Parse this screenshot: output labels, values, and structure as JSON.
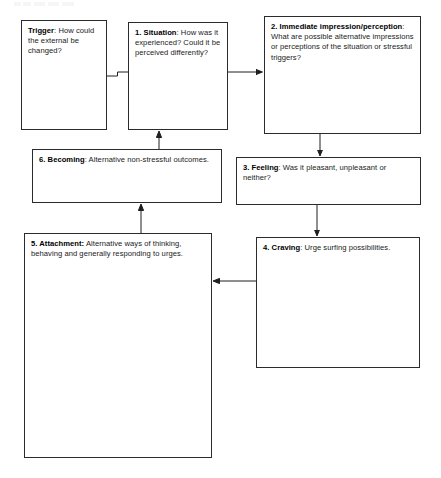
{
  "diagram": {
    "title_visible": false,
    "header_remnant": "",
    "type": "flowchart",
    "boxes": [
      {
        "id": "trigger",
        "label": "Trigger",
        "separator": ": ",
        "text": "How could the external be changed?"
      },
      {
        "id": "situation",
        "label": "1. Situation",
        "separator": ": ",
        "text": "How was it experienced? Could it be perceived differently?"
      },
      {
        "id": "impression",
        "label": "2. Immediate impression/perception",
        "separator": ": ",
        "text": "What are possible alternative impressions or perceptions of the situation or stressful triggers?"
      },
      {
        "id": "feeling",
        "label": "3. Feeling",
        "separator": ": ",
        "text": "Was it pleasant, unpleasant or neither?"
      },
      {
        "id": "craving",
        "label": "4. Craving",
        "separator": ": ",
        "text": "Urge surfing possibilities."
      },
      {
        "id": "attachment",
        "label": "5. Attachment:",
        "separator": " ",
        "text": "Alternative ways of thinking, behaving and generally responding to urges."
      },
      {
        "id": "becoming",
        "label": "6. Becoming",
        "separator": ": ",
        "text": "Alternative non-stressful outcomes."
      }
    ],
    "connectors": [
      {
        "id": "trigger-to-situation",
        "from": "trigger",
        "to": "situation",
        "arrowhead": false,
        "direction": "right"
      },
      {
        "id": "situation-to-impression",
        "from": "situation",
        "to": "impression",
        "arrowhead": true,
        "direction": "right"
      },
      {
        "id": "impression-to-feeling",
        "from": "impression",
        "to": "feeling",
        "arrowhead": true,
        "direction": "down"
      },
      {
        "id": "feeling-to-craving",
        "from": "feeling",
        "to": "craving",
        "arrowhead": true,
        "direction": "down"
      },
      {
        "id": "craving-to-attachment",
        "from": "craving",
        "to": "attachment",
        "arrowhead": true,
        "direction": "left"
      },
      {
        "id": "attachment-to-becoming",
        "from": "attachment",
        "to": "becoming",
        "arrowhead": true,
        "direction": "up"
      },
      {
        "id": "becoming-to-situation",
        "from": "becoming",
        "to": "situation",
        "arrowhead": true,
        "direction": "up"
      }
    ],
    "colors": {
      "border": "#2b2b2b",
      "text": "#1a1a1a",
      "arrow": "#1f1f1f",
      "background": "#ffffff"
    }
  }
}
